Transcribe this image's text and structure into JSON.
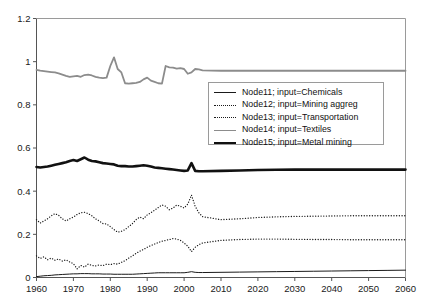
{
  "chart_data": {
    "type": "line",
    "title": "",
    "xlabel": "",
    "ylabel": "",
    "xlim": [
      1960,
      2060
    ],
    "ylim": [
      0,
      1.2
    ],
    "grid": false,
    "legend_position": "upper-center-right",
    "xticks": [
      "1960",
      "1970",
      "1980",
      "1990",
      "2000",
      "2010",
      "2020",
      "2030",
      "2040",
      "2050",
      "2060"
    ],
    "yticks": [
      "0",
      "0.2",
      "0.4",
      "0.6",
      "0.8",
      "1",
      "1.2"
    ],
    "x": [
      1960,
      1961,
      1962,
      1963,
      1964,
      1965,
      1966,
      1967,
      1968,
      1969,
      1970,
      1971,
      1972,
      1973,
      1974,
      1975,
      1976,
      1977,
      1978,
      1979,
      1980,
      1981,
      1982,
      1983,
      1984,
      1985,
      1986,
      1987,
      1988,
      1989,
      1990,
      1991,
      1992,
      1993,
      1994,
      1995,
      1996,
      1997,
      1998,
      1999,
      2000,
      2001,
      2002,
      2003,
      2004,
      2005,
      2010,
      2015,
      2020,
      2025,
      2030,
      2035,
      2040,
      2045,
      2050,
      2055,
      2060
    ],
    "series": [
      {
        "name": "Node11; input=Chemicals",
        "label": "Node11; input=Chemicals",
        "node": "Node11",
        "input": "Chemicals",
        "color": "#1a1a1a",
        "style": "solid",
        "width": 1,
        "values": [
          0.004,
          0.006,
          0.008,
          0.009,
          0.01,
          0.012,
          0.013,
          0.014,
          0.015,
          0.016,
          0.017,
          0.017,
          0.018,
          0.018,
          0.018,
          0.017,
          0.017,
          0.017,
          0.016,
          0.016,
          0.016,
          0.015,
          0.015,
          0.015,
          0.015,
          0.015,
          0.015,
          0.016,
          0.017,
          0.018,
          0.019,
          0.02,
          0.021,
          0.022,
          0.022,
          0.022,
          0.022,
          0.022,
          0.022,
          0.022,
          0.022,
          0.024,
          0.027,
          0.024,
          0.023,
          0.023,
          0.024,
          0.025,
          0.026,
          0.027,
          0.028,
          0.029,
          0.03,
          0.031,
          0.032,
          0.033,
          0.034
        ]
      },
      {
        "name": "Node12; input=Mining aggreg",
        "label": "Node12; input=Mining aggreg",
        "node": "Node12",
        "input": "Mining aggreg",
        "color": "#1a1a1a",
        "style": "dotted",
        "width": 1.3,
        "values": [
          0.1,
          0.088,
          0.096,
          0.082,
          0.09,
          0.08,
          0.086,
          0.076,
          0.082,
          0.072,
          0.064,
          0.04,
          0.056,
          0.048,
          0.062,
          0.056,
          0.054,
          0.058,
          0.055,
          0.062,
          0.06,
          0.064,
          0.062,
          0.07,
          0.078,
          0.09,
          0.1,
          0.112,
          0.122,
          0.13,
          0.14,
          0.148,
          0.155,
          0.162,
          0.168,
          0.172,
          0.176,
          0.18,
          0.178,
          0.172,
          0.16,
          0.145,
          0.12,
          0.14,
          0.152,
          0.16,
          0.172,
          0.176,
          0.178,
          0.178,
          0.177,
          0.176,
          0.176,
          0.175,
          0.175,
          0.175,
          0.175
        ]
      },
      {
        "name": "Node13; input=Transportation",
        "label": "Node13; input=Transportation",
        "node": "Node13",
        "input": "Transportation",
        "color": "#1a1a1a",
        "style": "dotted",
        "width": 1.3,
        "values": [
          0.268,
          0.252,
          0.262,
          0.272,
          0.286,
          0.296,
          0.288,
          0.272,
          0.262,
          0.272,
          0.28,
          0.292,
          0.3,
          0.302,
          0.296,
          0.286,
          0.272,
          0.262,
          0.25,
          0.248,
          0.236,
          0.222,
          0.21,
          0.214,
          0.222,
          0.236,
          0.25,
          0.268,
          0.28,
          0.272,
          0.29,
          0.3,
          0.312,
          0.324,
          0.336,
          0.33,
          0.314,
          0.322,
          0.336,
          0.33,
          0.322,
          0.34,
          0.382,
          0.33,
          0.3,
          0.282,
          0.268,
          0.272,
          0.278,
          0.281,
          0.283,
          0.284,
          0.285,
          0.286,
          0.286,
          0.286,
          0.286
        ]
      },
      {
        "name": "Node14; input=Textiles",
        "label": "Node14; input=Textiles",
        "node": "Node14",
        "input": "Textiles",
        "color": "#8c8c8c",
        "style": "solid",
        "width": 1.8,
        "values": [
          0.962,
          0.958,
          0.956,
          0.954,
          0.952,
          0.95,
          0.946,
          0.94,
          0.934,
          0.93,
          0.932,
          0.934,
          0.93,
          0.938,
          0.94,
          0.936,
          0.93,
          0.926,
          0.924,
          0.926,
          0.98,
          1.02,
          0.966,
          0.95,
          0.9,
          0.898,
          0.9,
          0.902,
          0.906,
          0.918,
          0.926,
          0.912,
          0.906,
          0.9,
          0.898,
          0.98,
          0.974,
          0.972,
          0.968,
          0.97,
          0.966,
          0.944,
          0.95,
          0.966,
          0.964,
          0.96,
          0.958,
          0.958,
          0.958,
          0.958,
          0.958,
          0.958,
          0.958,
          0.958,
          0.958,
          0.958,
          0.958
        ]
      },
      {
        "name": "Node15; input=Metal mining",
        "label": "Node15; input=Metal mining",
        "node": "Node15",
        "input": "Metal mining",
        "color": "#111111",
        "style": "solid",
        "width": 2.6,
        "values": [
          0.512,
          0.51,
          0.512,
          0.514,
          0.518,
          0.522,
          0.526,
          0.53,
          0.534,
          0.54,
          0.544,
          0.54,
          0.548,
          0.556,
          0.546,
          0.54,
          0.538,
          0.534,
          0.53,
          0.528,
          0.526,
          0.524,
          0.518,
          0.516,
          0.516,
          0.514,
          0.514,
          0.516,
          0.518,
          0.52,
          0.518,
          0.514,
          0.51,
          0.508,
          0.506,
          0.504,
          0.502,
          0.5,
          0.498,
          0.496,
          0.494,
          0.496,
          0.53,
          0.494,
          0.492,
          0.492,
          0.494,
          0.496,
          0.498,
          0.499,
          0.5,
          0.5,
          0.5,
          0.5,
          0.5,
          0.5,
          0.5
        ]
      }
    ]
  },
  "legend": {
    "entries": [
      {
        "label": "Node11; input=Chemicals"
      },
      {
        "label": "Node12; input=Mining aggreg"
      },
      {
        "label": "Node13; input=Transportation"
      },
      {
        "label": "Node14; input=Textiles"
      },
      {
        "label": "Node15; input=Metal mining"
      }
    ]
  }
}
